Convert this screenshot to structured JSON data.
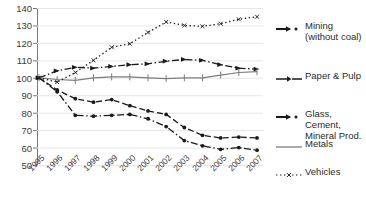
{
  "chart_data": {
    "type": "line",
    "title": "",
    "xlabel": "",
    "ylabel": "",
    "x": [
      "1995",
      "1996",
      "1997",
      "1998",
      "1999",
      "2000",
      "2001",
      "2002",
      "2003",
      "2004",
      "2005",
      "2006",
      "2007"
    ],
    "ylim": [
      50,
      140
    ],
    "yticks": [
      50,
      60,
      70,
      80,
      90,
      100,
      110,
      120,
      130,
      140
    ],
    "grid": true,
    "legend_position": "right",
    "series": [
      {
        "name": "Mining\n(without coal)",
        "style": "dash-dot",
        "marker": "arrow",
        "values": [
          100,
          104,
          106,
          105.5,
          106.5,
          107.5,
          108,
          109.5,
          110.5,
          110,
          107.5,
          105.5,
          105
        ]
      },
      {
        "name": "Paper & Pulp",
        "style": "dash",
        "marker": "dot",
        "values": [
          100,
          93,
          88,
          86,
          87.5,
          84,
          81,
          79,
          71.5,
          67,
          65.5,
          66,
          65.5
        ]
      },
      {
        "name": "Glass,\nCement,\nMineral Prod.",
        "style": "dash-dot",
        "marker": "dot",
        "values": [
          100,
          92,
          78.5,
          78,
          78.5,
          79,
          76.5,
          72,
          64,
          61,
          59,
          60,
          58.5
        ]
      },
      {
        "name": "Metals",
        "style": "solid",
        "marker": "tick",
        "values": [
          100,
          99,
          98.5,
          100,
          100.5,
          100.5,
          100,
          99.5,
          100,
          100,
          101.5,
          103,
          103.5
        ]
      },
      {
        "name": "Vehicles",
        "style": "dot",
        "marker": "x",
        "values": [
          100,
          97.5,
          103,
          110,
          117.5,
          119.5,
          126,
          132,
          130,
          129.5,
          131,
          133.5,
          135
        ]
      }
    ]
  },
  "legend": {
    "items": [
      {
        "label": "Mining\n(without coal)",
        "marker": "dash-dot-arrow-marker"
      },
      {
        "label": "Paper & Pulp",
        "marker": "dash-arrow-marker"
      },
      {
        "label": "Glass,\nCement,\nMineral Prod.",
        "marker": "dash-dot-dot-marker"
      },
      {
        "label": "Metals",
        "marker": "solid-line-marker"
      },
      {
        "label": "Vehicles",
        "marker": "dotted-x-marker"
      }
    ]
  },
  "axes": {
    "y_tick_labels": [
      "140",
      "130",
      "120",
      "110",
      "100",
      "90",
      "80",
      "70",
      "60",
      "50"
    ],
    "x_tick_labels": [
      "1995",
      "1996",
      "1997",
      "1998",
      "1999",
      "2000",
      "2001",
      "2002",
      "2003",
      "2004",
      "2005",
      "2006",
      "2007"
    ]
  },
  "colors": {
    "series_dark": "#1a1a1a",
    "metals_gray": "#7d7d7d",
    "grid": "#e6e6e6",
    "axis": "#7a7a7a",
    "text": "#2b2b2b"
  }
}
